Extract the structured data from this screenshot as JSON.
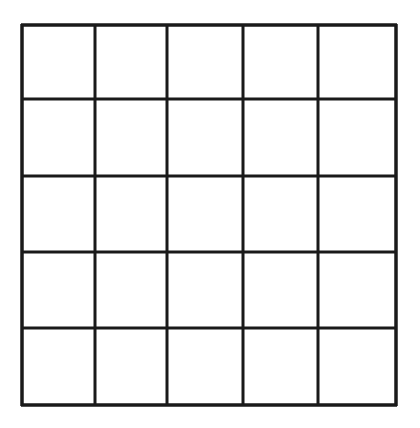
{
  "grid": {
    "rows": 5,
    "cols": 5,
    "x_lines": [
      22,
      95,
      167,
      243,
      318,
      396
    ],
    "y_lines": [
      25,
      99,
      176,
      252,
      328,
      405
    ],
    "line_color": "#1a1a1a",
    "background": "#ffffff",
    "cells": [
      [
        "",
        "",
        "",
        "",
        ""
      ],
      [
        "",
        "",
        "",
        "",
        ""
      ],
      [
        "",
        "",
        "",
        "",
        ""
      ],
      [
        "",
        "",
        "",
        "",
        ""
      ],
      [
        "",
        "",
        "",
        "",
        ""
      ]
    ]
  }
}
